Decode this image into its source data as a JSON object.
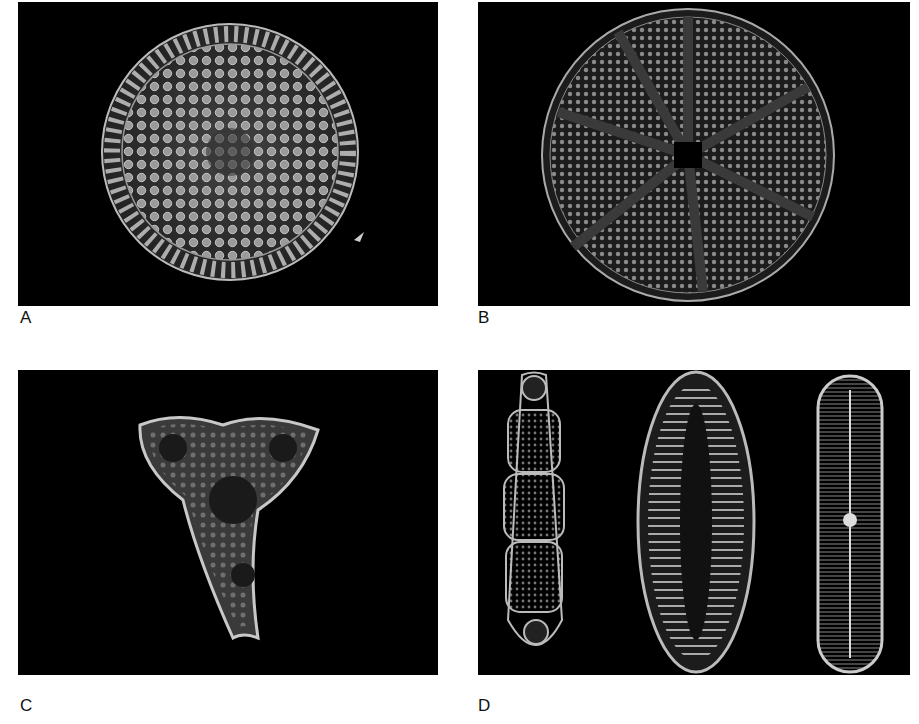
{
  "figure": {
    "panels": [
      {
        "id": "A",
        "label": "A",
        "subject": "radially symmetric centric diatom with hexagonal areolae and marginal ribs"
      },
      {
        "id": "B",
        "label": "B",
        "subject": "centric diatom with sectored radial pattern and central star-shaped hub"
      },
      {
        "id": "C",
        "label": "C",
        "subject": "triangular (trilobed) diatom valve"
      },
      {
        "id": "D",
        "label": "D",
        "subject": "three elongate pennate diatoms"
      }
    ],
    "colors": {
      "background": "#ffffff",
      "panel_bg": "#000000",
      "specimen": "#b8b8b8"
    }
  }
}
